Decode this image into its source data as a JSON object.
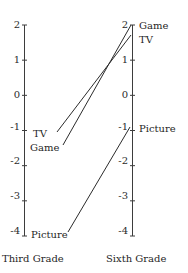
{
  "chart_data": {
    "type": "line",
    "title": "",
    "subtitle": "",
    "xlabel": "",
    "ylabel": "",
    "grid": false,
    "legend_position": "inline-endpoint-labels",
    "categories": [
      "Third Grade",
      "Sixth Grade"
    ],
    "axes": [
      {
        "name": "Third Grade",
        "label": "Third Grade",
        "ticks": [
          "2",
          "1",
          "0",
          "-1",
          "-2",
          "-3",
          "-4"
        ],
        "tick_values": [
          2,
          1,
          0,
          -1,
          -2,
          -3,
          -4
        ],
        "ylim": [
          -4,
          2
        ]
      },
      {
        "name": "Sixth Grade",
        "label": "Sixth Grade",
        "ticks": [
          "2",
          "1",
          "0",
          "-1",
          "-2",
          "-3",
          "-4"
        ],
        "tick_values": [
          2,
          1,
          0,
          -1,
          -2,
          -3,
          -4
        ],
        "ylim": [
          -4,
          2
        ]
      }
    ],
    "series": [
      {
        "name": "TV",
        "label_left": "TV",
        "label_right": "TV",
        "values": [
          -1.25,
          1.7
        ]
      },
      {
        "name": "Game",
        "label_left": "Game",
        "label_right": "Game",
        "values": [
          -1.6,
          2.0
        ]
      },
      {
        "name": "Picture",
        "label_left": "Picture",
        "label_right": "Picture",
        "values": [
          -4.05,
          -1.0
        ]
      }
    ]
  },
  "left_axis": {
    "title": "Third Grade",
    "ticks": [
      {
        "label": "2"
      },
      {
        "label": "1"
      },
      {
        "label": "0"
      },
      {
        "label": "-1"
      },
      {
        "label": "-2"
      },
      {
        "label": "-3"
      },
      {
        "label": "-4"
      }
    ],
    "point_labels": [
      {
        "text": "TV"
      },
      {
        "text": "Game"
      },
      {
        "text": "Picture"
      }
    ]
  },
  "right_axis": {
    "title": "Sixth Grade",
    "ticks": [
      {
        "label": "2"
      },
      {
        "label": "1"
      },
      {
        "label": "0"
      },
      {
        "label": "-1"
      },
      {
        "label": "-2"
      },
      {
        "label": "-3"
      },
      {
        "label": "-4"
      }
    ],
    "point_labels": [
      {
        "text": "Game"
      },
      {
        "text": "TV"
      },
      {
        "text": "Picture"
      }
    ]
  },
  "style": {
    "line_color": "#2b2b2b",
    "axis_color": "#3d3d3d",
    "text_color": "#1f1f1f",
    "background": "#ffffff"
  }
}
